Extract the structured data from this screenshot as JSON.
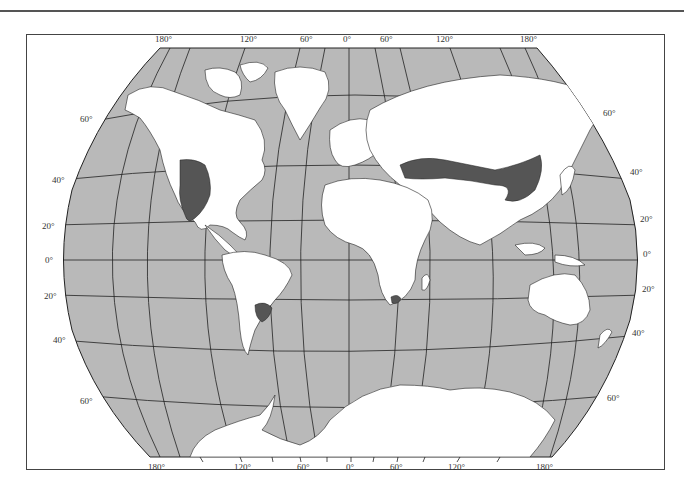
{
  "header": {
    "text": "CHAPTER TWO"
  },
  "map": {
    "title": "World map of temperate grassland distribution",
    "colors": {
      "ocean": "#b9b9b9",
      "land": "#ffffff",
      "highlighted_region": "#555555",
      "grid_line": "#222222",
      "frame": "#444444"
    },
    "longitude_labels_top": [
      "180°",
      "120°",
      "60°",
      "0°",
      "60°",
      "120°",
      "180°"
    ],
    "longitude_labels_bottom": [
      "180°",
      "120°",
      "60°",
      "0°",
      "60°",
      "120°",
      "180°"
    ],
    "latitude_labels_left": [
      "60°",
      "40°",
      "20°",
      "0°",
      "20°",
      "40°",
      "60°"
    ],
    "latitude_labels_right": [
      "60°",
      "40°",
      "20°",
      "0°",
      "20°",
      "40°",
      "60°"
    ],
    "highlighted_regions": [
      "North American Great Plains",
      "Eurasian Steppe",
      "South American Pampas",
      "South African Veld"
    ]
  }
}
